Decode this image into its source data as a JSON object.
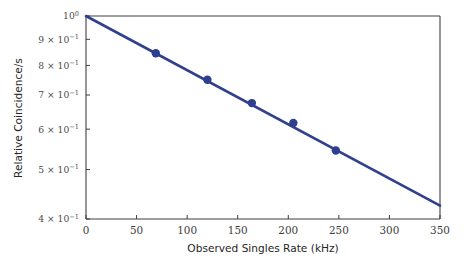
{
  "chart_data": {
    "type": "line",
    "title": "",
    "xlabel": "Observed Singles Rate (kHz)",
    "ylabel": "Relative Coincidence/s",
    "xlim": [
      0,
      350
    ],
    "ylim": [
      0.4,
      1.0
    ],
    "yscale": "log",
    "xscale": "linear",
    "grid": false,
    "legend": null,
    "xticks": [
      0,
      50,
      100,
      150,
      200,
      250,
      300,
      350
    ],
    "xticklabels": [
      "0",
      "50",
      "100",
      "150",
      "200",
      "250",
      "300",
      "350"
    ],
    "yticks": [
      1.0,
      0.9,
      0.8,
      0.7,
      0.6,
      0.5,
      0.4
    ],
    "yticklabels": [
      "10^0",
      "9 x 10^-1",
      "8 x 10^-1",
      "7 x 10^-1",
      "6 x 10^-1",
      "5 x 10^-1",
      "4 x 10^-1"
    ],
    "series": [
      {
        "name": "measured-data",
        "kind": "scatter",
        "marker": "circle",
        "color": "#2f3f8f",
        "x": [
          69,
          120,
          164,
          205,
          247
        ],
        "y": [
          0.845,
          0.75,
          0.675,
          0.617,
          0.545
        ]
      },
      {
        "name": "exponential-fit",
        "kind": "line",
        "color": "#31408c",
        "x": [
          0,
          350
        ],
        "y": [
          1.0,
          0.425
        ]
      }
    ]
  },
  "axes": {
    "x_title": "Observed Singles Rate (kHz)",
    "y_title": "Relative Coincidence/s",
    "x_ticks": [
      {
        "value": 0,
        "label": "0"
      },
      {
        "value": 50,
        "label": "50"
      },
      {
        "value": 100,
        "label": "100"
      },
      {
        "value": 150,
        "label": "150"
      },
      {
        "value": 200,
        "label": "200"
      },
      {
        "value": 250,
        "label": "250"
      },
      {
        "value": 300,
        "label": "300"
      },
      {
        "value": 350,
        "label": "350"
      }
    ],
    "y_ticks": [
      {
        "value": 1.0,
        "mantissa": "",
        "base": "10",
        "exponent": "0"
      },
      {
        "value": 0.9,
        "mantissa": "9 × ",
        "base": "10",
        "exponent": "−1"
      },
      {
        "value": 0.8,
        "mantissa": "8 × ",
        "base": "10",
        "exponent": "−1"
      },
      {
        "value": 0.7,
        "mantissa": "7 × ",
        "base": "10",
        "exponent": "−1"
      },
      {
        "value": 0.6,
        "mantissa": "6 × ",
        "base": "10",
        "exponent": "−1"
      },
      {
        "value": 0.5,
        "mantissa": "5 × ",
        "base": "10",
        "exponent": "−1"
      },
      {
        "value": 0.4,
        "mantissa": "4 × ",
        "base": "10",
        "exponent": "−1"
      }
    ]
  },
  "style": {
    "line_color": "#31408c",
    "marker_color": "#2f3f8f",
    "axis_color": "#3f3f3f",
    "background": "#ffffff",
    "line_width": 2.6,
    "marker_radius": 4.2
  }
}
